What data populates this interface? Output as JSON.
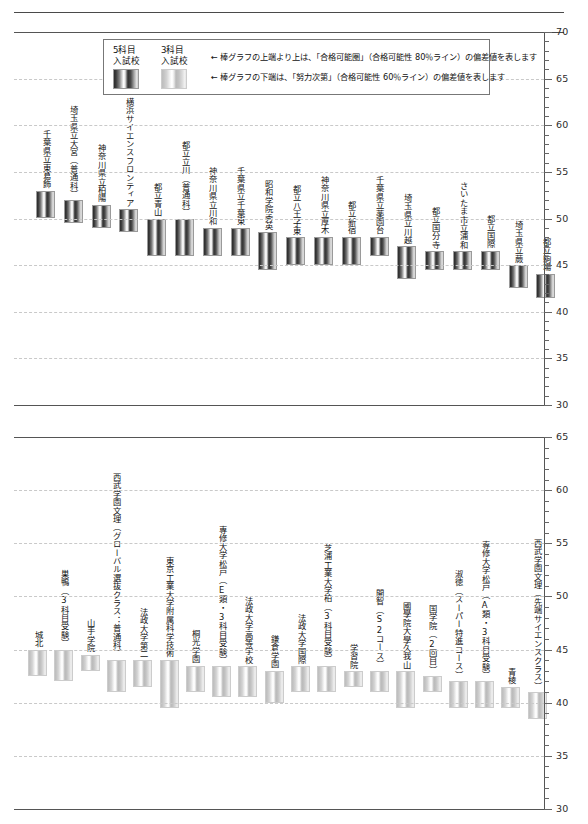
{
  "legend": {
    "keys": [
      {
        "name": "five-subject",
        "line1": "5科目",
        "line2": "入試校",
        "style": "dark"
      },
      {
        "name": "three-subject",
        "line1": "3科目",
        "line2": "入試校",
        "style": "light"
      }
    ],
    "notes": [
      "← 棒グラフの上端より上は、「合格可能圏」（合格可能性 80％ライン）の偏差値を表します",
      "← 棒グラフの下端は、「努力次第」（合格可能性 60％ライン）の偏差値を表します"
    ]
  },
  "chart_data": [
    {
      "type": "bar",
      "title": "",
      "id": "chart-top-5subject",
      "xlabel": "",
      "ylabel": "偏差値",
      "ylim": [
        30,
        70
      ],
      "ytick_labels": [
        "70",
        "65",
        "60",
        "55",
        "50",
        "45",
        "40",
        "35",
        "30"
      ],
      "ytick_values": [
        70,
        65,
        60,
        55,
        50,
        45,
        40,
        35,
        30
      ],
      "gridlines": [
        65,
        60,
        55,
        50,
        45,
        40,
        35
      ],
      "grid": true,
      "legend_position": "top-left",
      "series_style": "dark",
      "categories": [
        "千葉県立東葛飾",
        "埼玉県立大宮（普通科）",
        "神奈川県立柏陽",
        "横浜サイエンスフロンティア",
        "都立青山",
        "都立立川（普通科）",
        "神奈川県立川和",
        "千葉県立千葉東",
        "昭和学院秀英",
        "都立八王子東",
        "神奈川県立厚木",
        "都立新宿",
        "千葉県立薬園台",
        "埼玉県立川越",
        "都立国分寺",
        "さいたま市立浦和",
        "都立国際",
        "埼玉県立蕨",
        "都立駒場"
      ],
      "bar_tops": [
        53.0,
        52.0,
        51.5,
        51.0,
        50.0,
        50.0,
        49.0,
        49.0,
        48.5,
        48.0,
        48.0,
        48.0,
        48.0,
        47.0,
        46.5,
        46.5,
        46.5,
        45.0,
        44.0
      ],
      "bar_bottoms": [
        50.0,
        49.5,
        49.0,
        48.5,
        46.0,
        46.0,
        46.0,
        46.0,
        44.5,
        45.0,
        45.0,
        45.0,
        46.0,
        43.5,
        44.5,
        44.5,
        44.5,
        42.5,
        41.5
      ]
    },
    {
      "type": "bar",
      "title": "",
      "id": "chart-bottom-3subject",
      "xlabel": "",
      "ylabel": "偏差値",
      "ylim": [
        30,
        65
      ],
      "ytick_labels": [
        "65",
        "60",
        "55",
        "50",
        "45",
        "40",
        "35",
        "30"
      ],
      "ytick_values": [
        65,
        60,
        55,
        50,
        45,
        40,
        35,
        30
      ],
      "gridlines": [
        60,
        55,
        50,
        45,
        40,
        35
      ],
      "grid": true,
      "legend_position": "none",
      "series_style": "light",
      "categories": [
        "城北",
        "巣鴨（3科目受験）",
        "山手学院",
        "西武学園文理（グローバル選抜クラス：普通科）",
        "法政大学第二",
        "東京工業大学附属科学技術",
        "桐光学園",
        "専修大学松戸（E類・3科目受験）",
        "法政大学高等学校",
        "鎌倉学園",
        "法政大学国際",
        "芝浦工業大学柏（3科目受験）",
        "学習院",
        "開智（S2コース）",
        "國學院大學久我山",
        "国学院（2回目）",
        "淑徳（スーパー特進コース）",
        "専修大学松戸（A類・3科目受験）",
        "青稜",
        "西武学園文理（先端サイエンスクラス）"
      ],
      "bar_tops": [
        45.0,
        45.0,
        44.5,
        44.0,
        44.0,
        44.0,
        43.5,
        43.5,
        43.5,
        43.0,
        43.5,
        43.5,
        43.0,
        43.0,
        43.0,
        42.5,
        42.0,
        42.0,
        41.5,
        41.0
      ],
      "bar_bottoms": [
        42.5,
        42.0,
        43.0,
        41.0,
        41.5,
        39.5,
        41.0,
        40.5,
        40.5,
        40.0,
        41.0,
        41.0,
        41.5,
        41.0,
        39.5,
        41.0,
        39.5,
        39.5,
        39.5,
        38.5
      ]
    }
  ]
}
